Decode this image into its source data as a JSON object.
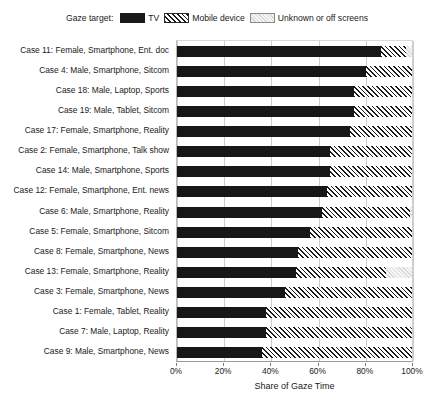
{
  "legend": {
    "title": "Gaze target:",
    "entries": [
      {
        "label": "TV",
        "key": "tv",
        "color": "#171717"
      },
      {
        "label": "Mobile device",
        "key": "mobile",
        "color": "#1b1b1b"
      },
      {
        "label": "Unknown or off screens",
        "key": "unknown",
        "color": "#dadada"
      }
    ]
  },
  "axis": {
    "x_title": "Share of Gaze Time",
    "x_ticks": [
      "0%",
      "20%",
      "40%",
      "60%",
      "80%",
      "100%"
    ],
    "x_tick_values": [
      0,
      20,
      40,
      60,
      80,
      100
    ]
  },
  "chart_data": {
    "type": "bar",
    "orientation": "horizontal",
    "stacked": true,
    "title": "",
    "xlabel": "Share of Gaze Time",
    "ylabel": "",
    "xlim": [
      0,
      100
    ],
    "grid": true,
    "legend_position": "top-center",
    "categories": [
      "Case 11: Female, Smartphone, Ent. doc",
      "Case 4: Male, Smartphone, Sitcom",
      "Case 18: Male, Laptop, Sports",
      "Case 19: Male, Tablet, Sitcom",
      "Case 17: Female, Smartphone, Reality",
      "Case 2: Female, Smartphone, Talk show",
      "Case 14: Male, Smartphone, Sports",
      "Case 12: Female, Smartphone, Ent. news",
      "Case 6: Male, Smartphone, Reality",
      "Case 5: Female, Smartphone, Sitcom",
      "Case 8: Female, Smartphone, News",
      "Case 13: Female, Smartphone, Reality",
      "Case 3: Female, Smartphone, News",
      "Case 1: Female, Tablet, Reality",
      "Case 7: Male, Laptop, Reality",
      "Case 9: Male, Smartphone, News"
    ],
    "series": [
      {
        "name": "TV",
        "key": "tv",
        "values": [
          87.0,
          80.6,
          75.5,
          75.5,
          73.8,
          65.0,
          65.0,
          63.7,
          61.6,
          56.5,
          51.5,
          50.6,
          46.0,
          38.0,
          38.0,
          36.0
        ]
      },
      {
        "name": "Mobile device",
        "key": "mobile",
        "values": [
          10.6,
          19.4,
          24.5,
          24.5,
          26.2,
          35.0,
          35.0,
          36.3,
          37.6,
          43.5,
          48.5,
          38.4,
          54.0,
          62.0,
          62.0,
          64.0
        ]
      },
      {
        "name": "Unknown or off screens",
        "key": "unknown",
        "values": [
          2.4,
          0.0,
          0.0,
          0.0,
          0.0,
          0.0,
          0.0,
          0.0,
          0.8,
          0.0,
          0.0,
          11.0,
          0.0,
          0.0,
          0.0,
          0.0
        ]
      }
    ]
  }
}
